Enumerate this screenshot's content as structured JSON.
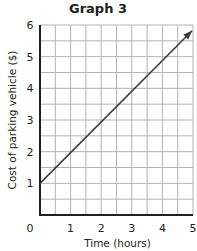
{
  "chart_data": {
    "type": "line",
    "title": "Graph 3",
    "xlabel": "Time (hours)",
    "ylabel": "Cost of parking vehicle ($)",
    "x": [
      0,
      1,
      2,
      3,
      4,
      5
    ],
    "series": [
      {
        "name": "Cost",
        "values": [
          1,
          2,
          3,
          4,
          5,
          6
        ],
        "arrow_end": true
      }
    ],
    "xlim": [
      0,
      5
    ],
    "ylim": [
      0,
      6
    ],
    "x_ticks": [
      "0",
      "1",
      "2",
      "3",
      "4",
      "5"
    ],
    "y_ticks": [
      "1",
      "2",
      "3",
      "4",
      "5",
      "6"
    ],
    "grid": {
      "on": true,
      "minor_step": 0.5
    },
    "legend": null
  },
  "colors": {
    "grid": "#b3b3b3",
    "axis": "#231f20",
    "line": "#3b3b3b"
  }
}
